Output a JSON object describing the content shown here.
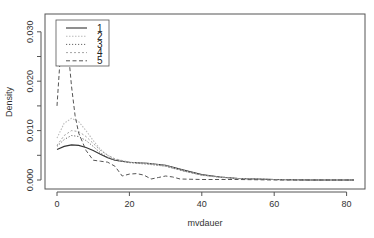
{
  "chart_data": {
    "type": "line",
    "title": "",
    "xlabel": "mvdauer",
    "ylabel": "Density",
    "xlim": [
      0,
      82
    ],
    "ylim": [
      0,
      0.032
    ],
    "x_ticks": [
      0,
      20,
      40,
      60,
      80
    ],
    "y_ticks": [
      0.0,
      0.01,
      0.02,
      0.03
    ],
    "x_tick_labels": [
      "0",
      "20",
      "40",
      "60",
      "80"
    ],
    "y_tick_labels": [
      "0.000",
      "0.010",
      "0.020",
      "0.030"
    ],
    "grid": false,
    "legend": {
      "position": "top-left",
      "entries": [
        "1",
        "2",
        "3",
        "4",
        "5"
      ]
    },
    "series": [
      {
        "name": "1",
        "style": "solid",
        "x": [
          0,
          2,
          4,
          6,
          8,
          10,
          12,
          14,
          16,
          20,
          25,
          30,
          35,
          40,
          45,
          50,
          55,
          60,
          70,
          82
        ],
        "y": [
          0.0062,
          0.0068,
          0.0071,
          0.007,
          0.0066,
          0.006,
          0.0052,
          0.0045,
          0.004,
          0.0036,
          0.0034,
          0.003,
          0.002,
          0.0011,
          0.0006,
          0.0003,
          0.0002,
          0.0001,
          0.0,
          0.0
        ]
      },
      {
        "name": "2",
        "style": "dotted-light",
        "x": [
          0,
          2,
          4,
          6,
          8,
          10,
          12,
          14,
          16,
          20,
          25,
          30,
          35,
          40,
          45,
          50,
          55,
          60,
          70,
          82
        ],
        "y": [
          0.0085,
          0.0115,
          0.0125,
          0.0118,
          0.01,
          0.008,
          0.0062,
          0.005,
          0.0042,
          0.0036,
          0.0034,
          0.0029,
          0.0019,
          0.001,
          0.0005,
          0.0003,
          0.0002,
          0.0001,
          0.0,
          0.0
        ]
      },
      {
        "name": "3",
        "style": "dotted",
        "x": [
          0,
          2,
          4,
          6,
          8,
          10,
          12,
          14,
          16,
          20,
          25,
          30,
          35,
          40,
          45,
          50,
          55,
          60,
          70,
          82
        ],
        "y": [
          0.0068,
          0.0082,
          0.009,
          0.0088,
          0.008,
          0.0068,
          0.0055,
          0.0046,
          0.004,
          0.0035,
          0.0032,
          0.0028,
          0.0018,
          0.001,
          0.0006,
          0.0003,
          0.0002,
          0.0001,
          0.0,
          0.0
        ]
      },
      {
        "name": "4",
        "style": "dotted-faint",
        "x": [
          0,
          2,
          4,
          6,
          8,
          10,
          12,
          14,
          16,
          20,
          25,
          30,
          35,
          40,
          45,
          50,
          55,
          60,
          70,
          82
        ],
        "y": [
          0.007,
          0.009,
          0.01,
          0.0098,
          0.0088,
          0.0074,
          0.006,
          0.005,
          0.0043,
          0.0036,
          0.0033,
          0.0028,
          0.0018,
          0.001,
          0.0006,
          0.0003,
          0.0002,
          0.0001,
          0.0,
          0.0
        ]
      },
      {
        "name": "5",
        "style": "dashed",
        "x": [
          0,
          1,
          2,
          3,
          4,
          5,
          6,
          8,
          10,
          12,
          14,
          16,
          18,
          20,
          22,
          24,
          26,
          28,
          30,
          32,
          34,
          40,
          50,
          60,
          70,
          82
        ],
        "y": [
          0.015,
          0.026,
          0.032,
          0.027,
          0.019,
          0.013,
          0.0095,
          0.006,
          0.004,
          0.0038,
          0.0036,
          0.0028,
          0.0008,
          0.0012,
          0.0013,
          0.001,
          0.0002,
          0.0005,
          0.0008,
          0.0006,
          0.0002,
          0.0001,
          0.0001,
          0.0,
          0.0,
          0.0
        ]
      }
    ]
  }
}
